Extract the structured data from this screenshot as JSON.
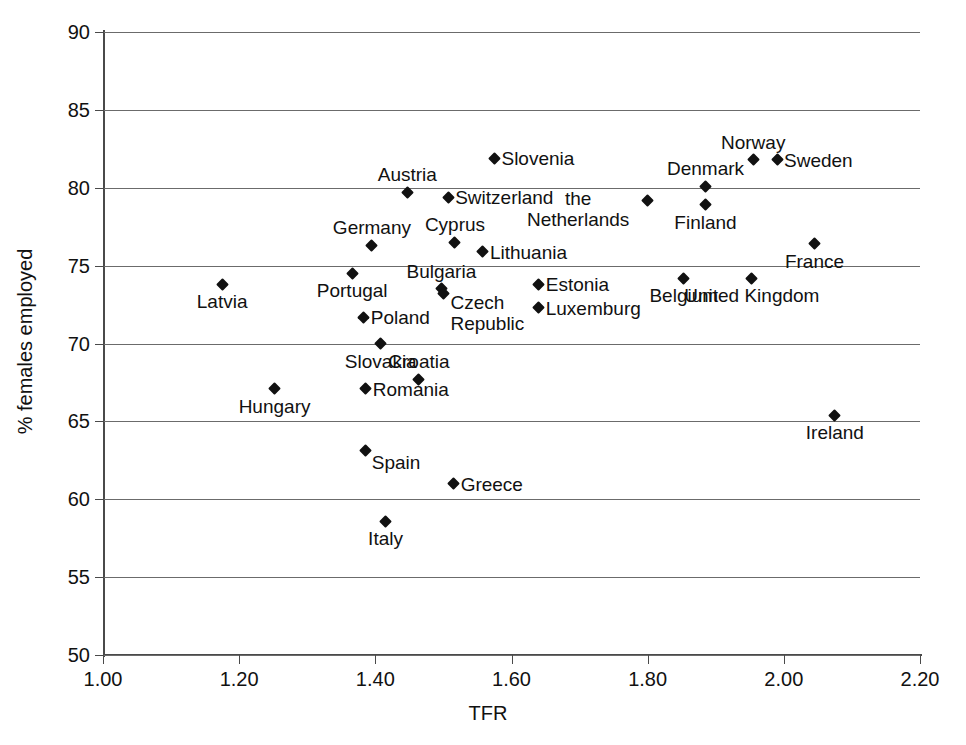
{
  "chart_data": {
    "type": "scatter",
    "title": "",
    "xlabel": "TFR",
    "ylabel": "% females employed",
    "xlim": [
      1.0,
      2.2
    ],
    "ylim": [
      50,
      90
    ],
    "xticks": [
      "1.00",
      "1.20",
      "1.40",
      "1.60",
      "1.80",
      "2.00",
      "2.20"
    ],
    "xtick_values": [
      1.0,
      1.2,
      1.4,
      1.6,
      1.8,
      2.0,
      2.2
    ],
    "yticks": [
      "90",
      "85",
      "80",
      "75",
      "70",
      "65",
      "60",
      "55",
      "50"
    ],
    "ytick_values": [
      90,
      85,
      80,
      75,
      70,
      65,
      60,
      55,
      50
    ],
    "grid": "horizontal",
    "legend": "none",
    "points": [
      {
        "label": "Slovenia",
        "x": 1.575,
        "y": 81.9,
        "label_pos": "right"
      },
      {
        "label": "Norway",
        "x": 1.955,
        "y": 81.8,
        "label_pos": "above"
      },
      {
        "label": "Sweden",
        "x": 1.99,
        "y": 81.8,
        "label_pos": "right"
      },
      {
        "label": "Denmark",
        "x": 1.885,
        "y": 80.1,
        "label_pos": "above"
      },
      {
        "label": "Austria",
        "x": 1.447,
        "y": 79.7,
        "label_pos": "above"
      },
      {
        "label": "Switzerland",
        "x": 1.507,
        "y": 79.4,
        "label_pos": "right"
      },
      {
        "label": "the Netherlands",
        "x": 1.8,
        "y": 79.2,
        "label_pos": "left-two-line"
      },
      {
        "label": "Finland",
        "x": 1.885,
        "y": 78.9,
        "label_pos": "below"
      },
      {
        "label": "Cyprus",
        "x": 1.517,
        "y": 76.5,
        "label_pos": "above"
      },
      {
        "label": "Germany",
        "x": 1.395,
        "y": 76.3,
        "label_pos": "above"
      },
      {
        "label": "France",
        "x": 2.045,
        "y": 76.4,
        "label_pos": "below"
      },
      {
        "label": "Lithuania",
        "x": 1.558,
        "y": 75.9,
        "label_pos": "right"
      },
      {
        "label": "Portugal",
        "x": 1.366,
        "y": 74.5,
        "label_pos": "below"
      },
      {
        "label": "Belgium",
        "x": 1.853,
        "y": 74.2,
        "label_pos": "below"
      },
      {
        "label": "United Kingdom",
        "x": 1.953,
        "y": 74.2,
        "label_pos": "below"
      },
      {
        "label": "Estonia",
        "x": 1.64,
        "y": 73.8,
        "label_pos": "right"
      },
      {
        "label": "Latvia",
        "x": 1.175,
        "y": 73.8,
        "label_pos": "below"
      },
      {
        "label": "Bulgaria",
        "x": 1.497,
        "y": 73.5,
        "label_pos": "above"
      },
      {
        "label": "Czech Republic",
        "x": 1.5,
        "y": 73.2,
        "label_pos": "right-two-line"
      },
      {
        "label": "Luxemburg",
        "x": 1.64,
        "y": 72.3,
        "label_pos": "right"
      },
      {
        "label": "Poland",
        "x": 1.383,
        "y": 71.7,
        "label_pos": "right"
      },
      {
        "label": "Slovakia",
        "x": 1.408,
        "y": 70.0,
        "label_pos": "below"
      },
      {
        "label": "Croatia",
        "x": 1.464,
        "y": 67.7,
        "label_pos": "above"
      },
      {
        "label": "Romania",
        "x": 1.386,
        "y": 67.1,
        "label_pos": "right"
      },
      {
        "label": "Hungary",
        "x": 1.252,
        "y": 67.1,
        "label_pos": "below"
      },
      {
        "label": "Ireland",
        "x": 2.075,
        "y": 65.4,
        "label_pos": "below"
      },
      {
        "label": "Spain",
        "x": 1.386,
        "y": 63.1,
        "label_pos": "right-below"
      },
      {
        "label": "Greece",
        "x": 1.515,
        "y": 61.0,
        "label_pos": "right"
      },
      {
        "label": "Italy",
        "x": 1.415,
        "y": 58.6,
        "label_pos": "below"
      }
    ]
  }
}
